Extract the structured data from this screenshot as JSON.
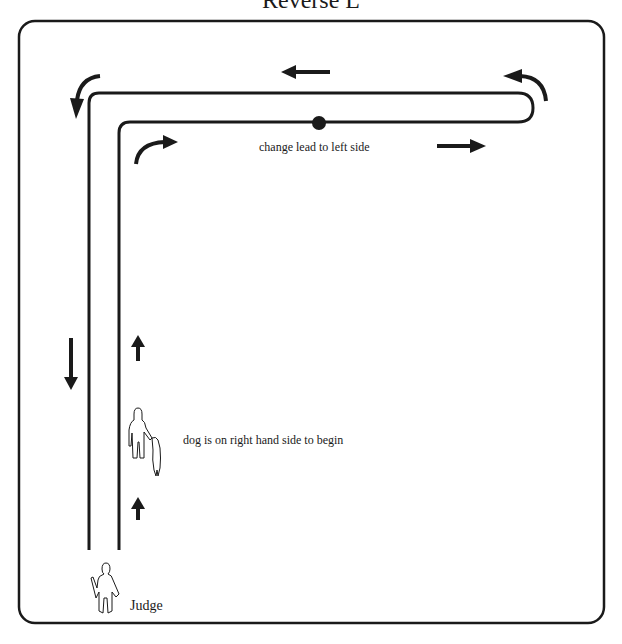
{
  "title": "Reverse L",
  "labels": {
    "change_lead": "change lead to left side",
    "dog_start": "dog is on right hand side to begin",
    "judge": "Judge"
  },
  "colors": {
    "line": "#1a1a1a",
    "background": "#ffffff"
  },
  "icons": {
    "handler_with_dog": "person-with-dog-outline",
    "judge": "person-outline",
    "marker": "filled-dot",
    "arrows": [
      "arrow-up",
      "arrow-up",
      "curved-arrow-right",
      "arrow-right",
      "curved-arrow-up-left",
      "arrow-left",
      "curved-arrow-down-left",
      "arrow-down"
    ]
  }
}
